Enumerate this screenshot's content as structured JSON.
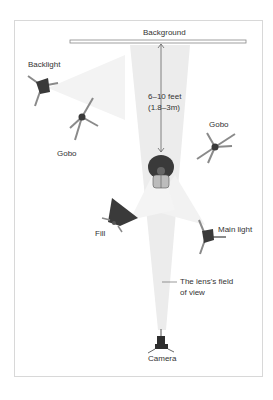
{
  "diagram": {
    "labels": {
      "background": "Background",
      "backlight": "Backlight",
      "gobo_left": "Gobo",
      "gobo_right": "Gobo",
      "distance_line1": "6–10 feet",
      "distance_line2": "(1.8–3m)",
      "fill": "Fill",
      "main_light": "Main light",
      "fov_line1": "The lens's field",
      "fov_line2": "of view",
      "camera": "Camera"
    },
    "icons": [
      "background-bar-icon",
      "backlight-icon",
      "gobo-icon",
      "subject-icon",
      "fill-softbox-icon",
      "main-light-icon",
      "camera-icon"
    ],
    "colors": {
      "frame": "#d8d8d8",
      "cone": "#e6e6e6",
      "equipment": "#3a3a3a",
      "stand": "#8a8a8a",
      "text": "#333333"
    }
  }
}
